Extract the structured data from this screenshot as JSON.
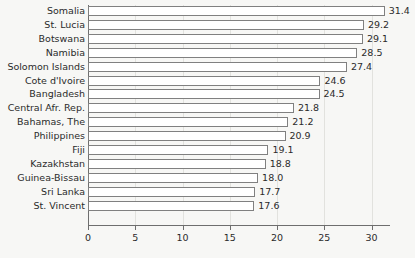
{
  "chart_data": {
    "type": "bar",
    "orientation": "horizontal",
    "title": "",
    "subtitle": "",
    "xlabel": "",
    "ylabel": "",
    "xlim": [
      0,
      32
    ],
    "xticks": [
      0,
      5,
      10,
      15,
      20,
      25,
      30
    ],
    "xtick_labels": [
      "0",
      "5",
      "10",
      "15",
      "20",
      "25",
      "30"
    ],
    "grid": "vertical",
    "legend": "none",
    "data_labels": true,
    "categories": [
      "Somalia",
      "St. Lucia",
      "Botswana",
      "Namibia",
      "Solomon Islands",
      "Cote d'Ivoire",
      "Bangladesh",
      "Central Afr. Rep.",
      "Bahamas, The",
      "Philippines",
      "Fiji",
      "Kazakhstan",
      "Guinea-Bissau",
      "Sri Lanka",
      "St. Vincent"
    ],
    "values": [
      31.4,
      29.2,
      29.1,
      28.5,
      27.4,
      24.6,
      24.5,
      21.8,
      21.2,
      20.9,
      19.1,
      18.8,
      18.0,
      17.7,
      17.6
    ],
    "value_labels": [
      "31.4",
      "29.2",
      "29.1",
      "28.5",
      "27.4",
      "24.6",
      "24.5",
      "21.8",
      "21.2",
      "20.9",
      "19.1",
      "18.8",
      "18.0",
      "17.7",
      "17.6"
    ],
    "colors": {
      "background": "#f7f7f5",
      "bar_fill": "#ffffff",
      "bar_border": "#808080",
      "axis": "#6e6e6e",
      "grid": "#e2e2de",
      "text": "#2b2b2b"
    }
  }
}
